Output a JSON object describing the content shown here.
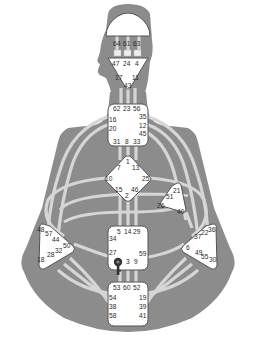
{
  "diagram": {
    "type": "human-design-bodygraph",
    "colors": {
      "background": "#ffffff",
      "body": "#8c8c8c",
      "channel": "#d6d6d6",
      "center_fill": "#ffffff",
      "center_stroke": "#555555",
      "text": "#2a2a2a"
    },
    "centers": {
      "head": {
        "gates": [
          "64",
          "61",
          "63"
        ]
      },
      "ajna": {
        "gates": [
          "47",
          "24",
          "4",
          "17",
          "11",
          "43"
        ]
      },
      "throat": {
        "gates": [
          "62",
          "23",
          "56",
          "16",
          "35",
          "20",
          "12",
          "45",
          "31",
          "8",
          "33"
        ]
      },
      "g": {
        "gates": [
          "1",
          "7",
          "13",
          "10",
          "25",
          "15",
          "46",
          "2"
        ]
      },
      "heart": {
        "gates": [
          "21",
          "51",
          "26",
          "40"
        ]
      },
      "spleen": {
        "gates": [
          "48",
          "57",
          "44",
          "50",
          "32",
          "28",
          "18"
        ]
      },
      "sacral": {
        "gates": [
          "5",
          "14",
          "29",
          "34",
          "27",
          "59",
          "42",
          "3",
          "9"
        ]
      },
      "solar_plexus": {
        "gates": [
          "36",
          "22",
          "37",
          "6",
          "49",
          "55",
          "30"
        ]
      },
      "root": {
        "gates": [
          "53",
          "60",
          "52",
          "54",
          "19",
          "38",
          "39",
          "58",
          "41"
        ]
      }
    },
    "markers": [
      {
        "name": "key-icon",
        "center": "sacral",
        "near_gate": "42"
      }
    ]
  }
}
